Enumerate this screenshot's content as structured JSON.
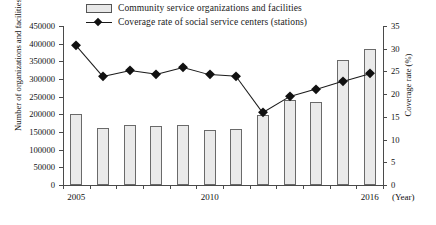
{
  "legend": {
    "items": [
      {
        "label": "Community service organizations and facilities",
        "marker": "bar-swatch"
      },
      {
        "label": "Coverage rate of social service centers (stations)",
        "marker": "line-diamond"
      }
    ]
  },
  "axes": {
    "left_title": "Number of organizations and facilities",
    "right_title": "Coverage rate (%)",
    "x_unit": "(Year)",
    "left_ticks": [
      "0",
      "50000",
      "100000",
      "150000",
      "200000",
      "250000",
      "300000",
      "350000",
      "400000",
      "450000"
    ],
    "right_ticks": [
      "0",
      "5",
      "10",
      "15",
      "20",
      "25",
      "30",
      "35"
    ],
    "x_labels": [
      "2005",
      "2010",
      "2016"
    ]
  },
  "chart_data": {
    "type": "bar",
    "title": "",
    "xlabel": "(Year)",
    "ylabel": "Number of organizations and facilities",
    "y2label": "Coverage rate (%)",
    "ylim": [
      0,
      450000
    ],
    "y2lim": [
      0,
      35
    ],
    "grid": false,
    "legend_position": "top",
    "categories": [
      "2005",
      "2006",
      "2007",
      "2008",
      "2009",
      "2010",
      "2011",
      "2012",
      "2013",
      "2014",
      "2015",
      "2016"
    ],
    "series": [
      {
        "name": "Community service organizations and facilities",
        "type": "bar",
        "axis": "left",
        "values": [
          201000,
          162000,
          170000,
          168000,
          171000,
          156000,
          159000,
          197000,
          240000,
          234000,
          355000,
          385000
        ]
      },
      {
        "name": "Coverage rate of social service centers (stations)",
        "type": "line",
        "axis": "right",
        "values": [
          30.8,
          24.0,
          25.3,
          24.5,
          26.0,
          24.4,
          24.0,
          16.0,
          19.5,
          21.2,
          23.0,
          24.7
        ]
      }
    ]
  }
}
